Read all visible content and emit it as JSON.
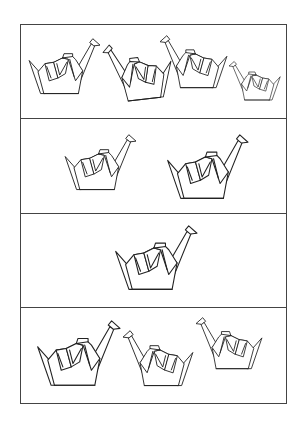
{
  "figure": {
    "background": "#ffffff",
    "line_color": "#444444",
    "frame": {
      "left": 20,
      "top": 24,
      "right": 287,
      "bottom": 404
    },
    "dividers_y": [
      118,
      213,
      307
    ],
    "panels": [
      {
        "name": "panel-1",
        "count": 4,
        "cranes": [
          {
            "x": 28,
            "y": 38,
            "w": 72,
            "h": 57,
            "facing": "right",
            "rotate": 0
          },
          {
            "x": 105,
            "y": 41,
            "w": 68,
            "h": 60,
            "facing": "left",
            "rotate": 6
          },
          {
            "x": 160,
            "y": 35,
            "w": 68,
            "h": 54,
            "facing": "left",
            "rotate": 0
          },
          {
            "x": 229,
            "y": 61,
            "w": 52,
            "h": 40,
            "facing": "left",
            "rotate": 0
          }
        ]
      },
      {
        "name": "panel-2",
        "count": 2,
        "cranes": [
          {
            "x": 64,
            "y": 134,
            "w": 72,
            "h": 57,
            "facing": "right",
            "rotate": 0
          },
          {
            "x": 166,
            "y": 134,
            "w": 82,
            "h": 66,
            "facing": "right",
            "rotate": 0
          }
        ]
      },
      {
        "name": "panel-3",
        "count": 1,
        "cranes": [
          {
            "x": 114,
            "y": 225,
            "w": 83,
            "h": 66,
            "facing": "right",
            "rotate": 0
          }
        ]
      },
      {
        "name": "panel-4",
        "count": 3,
        "cranes": [
          {
            "x": 36,
            "y": 320,
            "w": 84,
            "h": 67,
            "facing": "right",
            "rotate": 0
          },
          {
            "x": 123,
            "y": 330,
            "w": 71,
            "h": 57,
            "facing": "left",
            "rotate": 0
          },
          {
            "x": 196,
            "y": 317,
            "w": 67,
            "h": 53,
            "facing": "left",
            "rotate": 0
          }
        ]
      }
    ]
  }
}
